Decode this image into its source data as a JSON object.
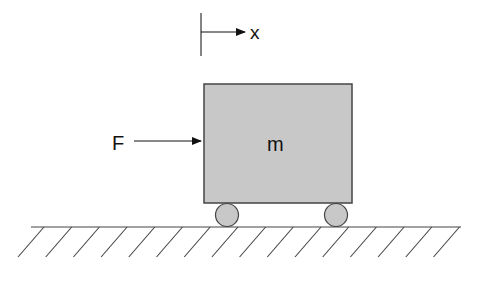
{
  "diagram": {
    "labels": {
      "displacement": "x",
      "force": "F",
      "mass": "m"
    },
    "colors": {
      "background": "#ffffff",
      "mass_fill": "#c8c8c8",
      "wheel_fill": "#c8c8c8",
      "stroke": "#333333",
      "ground": "#444444"
    },
    "ground": {
      "x1": 31,
      "x2": 461,
      "y": 227,
      "hatch_count": 16,
      "hatch_spacing": 27.7,
      "hatch_first_top_x": 44,
      "hatch_dx": 26,
      "hatch_dy": 30
    }
  }
}
